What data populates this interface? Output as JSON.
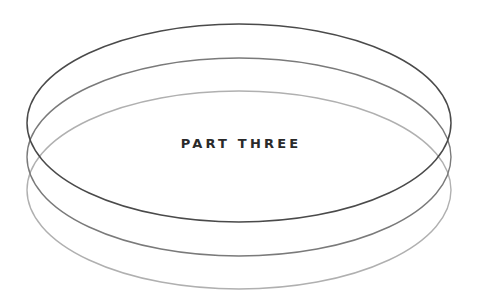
{
  "title": "PART THREE",
  "rings": [
    {
      "name": "top-ring",
      "cx": 239,
      "cy": 123,
      "rx": 212,
      "ry": 99,
      "stroke": "#4a4a4a"
    },
    {
      "name": "middle-ring",
      "cx": 239,
      "cy": 157,
      "rx": 212,
      "ry": 99,
      "stroke": "#7a7a7a"
    },
    {
      "name": "bottom-ring",
      "cx": 239,
      "cy": 190,
      "rx": 212,
      "ry": 99,
      "stroke": "#b0b0b0"
    }
  ]
}
